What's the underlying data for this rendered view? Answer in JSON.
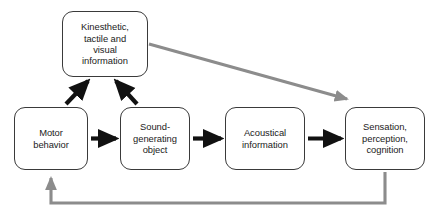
{
  "diagram": {
    "colors": {
      "box_border": "#3a3a3a",
      "box_fill": "#ffffff",
      "forward_arrow": "#111111",
      "feedback_arrow": "#8c8c8c",
      "text": "#1b1b1b",
      "background": "#ffffff"
    },
    "nodes": [
      {
        "id": "kinesthetic",
        "label": "Kinesthetic,\ntactile and\nvisual\ninformation",
        "x": 62,
        "y": 11,
        "w": 86,
        "h": 66
      },
      {
        "id": "motor-behavior",
        "label": "Motor\nbehavior",
        "x": 14,
        "y": 107,
        "w": 74,
        "h": 63
      },
      {
        "id": "sound-generating-object",
        "label": "Sound-\ngenerating\nobject",
        "x": 120,
        "y": 107,
        "w": 70,
        "h": 63
      },
      {
        "id": "acoustical-information",
        "label": "Acoustical\ninformation",
        "x": 225,
        "y": 107,
        "w": 80,
        "h": 63
      },
      {
        "id": "sensation-perception-cognition",
        "label": "Sensation,\nperception,\ncognition",
        "x": 345,
        "y": 107,
        "w": 80,
        "h": 63
      }
    ],
    "edges": [
      {
        "id": "motor-to-sound",
        "from": "motor-behavior",
        "to": "sound-generating-object",
        "style": "forward",
        "kind": "straight-horizontal"
      },
      {
        "id": "sound-to-acoustical",
        "from": "sound-generating-object",
        "to": "acoustical-information",
        "style": "forward",
        "kind": "straight-horizontal"
      },
      {
        "id": "acoustical-to-sensation",
        "from": "acoustical-information",
        "to": "sensation-perception-cognition",
        "style": "forward",
        "kind": "straight-horizontal"
      },
      {
        "id": "motor-to-kinesthetic",
        "from": "motor-behavior",
        "to": "kinesthetic",
        "style": "forward",
        "kind": "diagonal-up-right"
      },
      {
        "id": "sound-to-kinesthetic",
        "from": "sound-generating-object",
        "to": "kinesthetic",
        "style": "forward",
        "kind": "diagonal-up-left"
      },
      {
        "id": "kinesthetic-to-sensation",
        "from": "kinesthetic",
        "to": "sensation-perception-cognition",
        "style": "feedback",
        "kind": "diagonal-down-right"
      },
      {
        "id": "sensation-to-motor",
        "from": "sensation-perception-cognition",
        "to": "motor-behavior",
        "style": "feedback",
        "kind": "elbow-return-bottom"
      }
    ]
  }
}
